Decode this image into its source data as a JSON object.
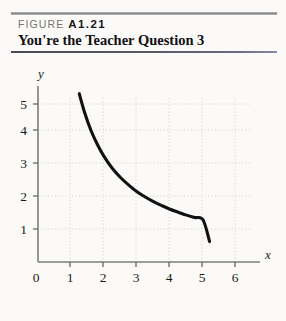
{
  "figure": {
    "label_prefix": "FIGURE",
    "number": "A1.21",
    "title": "You're the Teacher Question 3"
  },
  "colors": {
    "page_background": "#fbfaf8",
    "rule_top": "#9a9a9a",
    "rule_mid": "#4b4b55",
    "rule_bottom": "#9a9a9a",
    "curve": "#111111",
    "axis": "#7d7d7d",
    "grid": "#cfcfcf",
    "text": "#111114"
  },
  "chart_data": {
    "type": "line",
    "title": "You're the Teacher Question 3",
    "xlabel": "x",
    "ylabel": "y",
    "xlim": [
      0,
      6.4
    ],
    "ylim": [
      0,
      5.7
    ],
    "xticks": [
      0,
      1,
      2,
      3,
      4,
      5,
      6
    ],
    "xtick_labels": [
      "0",
      "1",
      "2",
      "3",
      "4",
      "5",
      "6"
    ],
    "yticks": [
      1,
      2,
      3,
      4,
      5
    ],
    "ytick_labels": [
      "1",
      "2",
      "3",
      "4",
      "5"
    ],
    "grid": "dotted light gray at every integer tick",
    "legend": "none",
    "series": [
      {
        "name": "decreasing curve",
        "relation": "y = 6.4 / x",
        "x": [
          1.25,
          1.4,
          1.6,
          1.8,
          2.0,
          2.25,
          2.5,
          2.75,
          3.0,
          3.25,
          3.5,
          3.75,
          4.0,
          4.25,
          4.5,
          4.75,
          5.0,
          5.2
        ],
        "y": [
          5.1,
          4.57,
          4.0,
          3.56,
          3.2,
          2.84,
          2.56,
          2.33,
          2.13,
          1.97,
          1.83,
          1.71,
          1.6,
          1.51,
          1.42,
          1.35,
          1.28,
          0.62
        ]
      }
    ],
    "annotations": [
      "curve begins at approximately (1.25, 5.1)",
      "curve ends at approximately (5.2, 0.6)",
      "curve is smooth, convex, monotonically decreasing"
    ]
  }
}
